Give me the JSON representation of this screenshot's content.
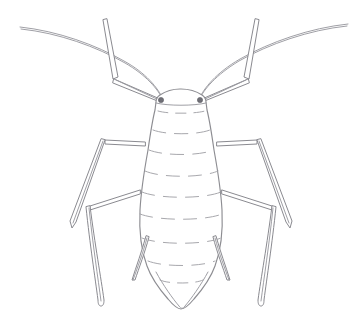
{
  "figure": {
    "title": "Aphid, dorsal view",
    "subject": "aphid",
    "view": "dorsal",
    "style": "pen-and-ink scientific line drawing",
    "caption": "",
    "background_color": "#ffffff",
    "ink_color": "#8d8d92",
    "segment_line_color": "#a2a2a8",
    "eye_color": "#6f6f76",
    "canvas": {
      "width": 362,
      "height": 324
    }
  },
  "anatomy": {
    "head": {
      "label": "head",
      "eyes": [
        {
          "label": "left-compound-eye",
          "cx": 161,
          "cy": 100,
          "r": 2.6
        },
        {
          "label": "right-compound-eye",
          "cx": 200,
          "cy": 100,
          "r": 2.6
        }
      ]
    },
    "antennae": [
      {
        "label": "left-antenna",
        "tip_x": 20,
        "tip_y": 27,
        "base_x": 163,
        "base_y": 99
      },
      {
        "label": "right-antenna",
        "tip_x": 348,
        "tip_y": 24,
        "base_x": 199,
        "base_y": 99
      }
    ],
    "legs": [
      {
        "label": "front-left-leg",
        "pair": "front",
        "side": "left"
      },
      {
        "label": "front-right-leg",
        "pair": "front",
        "side": "right"
      },
      {
        "label": "middle-left-leg",
        "pair": "middle",
        "side": "left"
      },
      {
        "label": "middle-right-leg",
        "pair": "middle",
        "side": "right"
      },
      {
        "label": "hind-left-leg",
        "pair": "hind",
        "side": "left"
      },
      {
        "label": "hind-right-leg",
        "pair": "hind",
        "side": "right"
      }
    ],
    "thorax": {
      "label": "thorax"
    },
    "abdomen": {
      "label": "abdomen",
      "segment_lines_count": 9
    },
    "cornicles": [
      {
        "label": "left-cornicle",
        "top_x": 147,
        "top_y": 238,
        "bottom_x": 136,
        "bottom_y": 281
      },
      {
        "label": "right-cornicle",
        "top_x": 223,
        "top_y": 238,
        "bottom_x": 233,
        "bottom_y": 281
      }
    ],
    "cauda": {
      "label": "cauda",
      "tip_x": 183,
      "tip_y": 308
    }
  }
}
